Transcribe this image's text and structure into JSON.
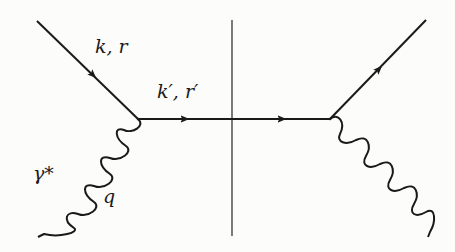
{
  "diagram": {
    "type": "feynman-cut-diagram",
    "stroke_color": "#1a1a1a",
    "cut_color": "#333333",
    "background": "#fcfcfb",
    "labels": {
      "incoming_fermion": "k, r",
      "propagator": "k′, r′",
      "photon_name": "γ*",
      "photon_momentum": "q"
    },
    "vertices": {
      "left": [
        138,
        119
      ],
      "right": [
        330,
        119
      ]
    },
    "lines": {
      "incoming_fermion": {
        "from": [
          37,
          21
        ],
        "to": [
          138,
          119
        ],
        "arrow_at": 0.55
      },
      "propagator": {
        "from": [
          138,
          119
        ],
        "to": [
          330,
          119
        ],
        "arrows_x": [
          183,
          280
        ]
      },
      "outgoing_fermion": {
        "from": [
          330,
          119
        ],
        "to": [
          426,
          20
        ],
        "arrow_at": 0.45
      },
      "left_photon": {
        "from": [
          138,
          119
        ],
        "to": [
          38,
          237
        ]
      },
      "right_photon": {
        "from": [
          330,
          119
        ],
        "to": [
          428,
          237
        ]
      },
      "cut": {
        "x": 232,
        "y1": 20,
        "y2": 236
      }
    }
  }
}
